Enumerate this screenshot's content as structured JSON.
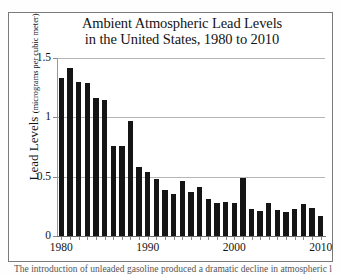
{
  "figure": {
    "background_color": "#ffffff",
    "frame_color": "#7a7a7a",
    "bar_color": "#151515",
    "grid_color": "#b6b6b6"
  },
  "title": {
    "line1": "Ambient Atmospheric Lead Levels",
    "line2": "in the United States, 1980 to 2010"
  },
  "yaxis": {
    "label_main": "Lead Levels ",
    "label_units": "(micrograms per cubic meter)",
    "ticks": [
      "0",
      "0.5",
      "1",
      "1.5"
    ]
  },
  "xaxis": {
    "ticks": [
      "1980",
      "1990",
      "2000",
      "2010"
    ]
  },
  "caption": {
    "text": "The introduction of unleaded gasoline produced a dramatic decline in atmospheric lead"
  },
  "chart_data": {
    "type": "bar",
    "title": "Ambient Atmospheric Lead Levels in the United States, 1980 to 2010",
    "xlabel": "",
    "ylabel": "Lead Levels (micrograms per cubic meter)",
    "ylim": [
      0,
      1.5
    ],
    "xlim": [
      1979.5,
      2010.5
    ],
    "yticks": [
      0,
      0.5,
      1,
      1.5
    ],
    "xticks": [
      1980,
      1990,
      2000,
      2010
    ],
    "grid": true,
    "legend": null,
    "categories": [
      "1980",
      "1981",
      "1982",
      "1983",
      "1984",
      "1985",
      "1986",
      "1987",
      "1988",
      "1989",
      "1990",
      "1991",
      "1992",
      "1993",
      "1994",
      "1995",
      "1996",
      "1997",
      "1998",
      "1999",
      "2000",
      "2001",
      "2002",
      "2003",
      "2004",
      "2005",
      "2006",
      "2007",
      "2008",
      "2009",
      "2010"
    ],
    "values": [
      1.33,
      1.42,
      1.3,
      1.29,
      1.16,
      1.15,
      0.76,
      0.76,
      0.97,
      0.58,
      0.54,
      0.48,
      0.39,
      0.35,
      0.46,
      0.37,
      0.41,
      0.31,
      0.28,
      0.29,
      0.28,
      0.49,
      0.23,
      0.21,
      0.28,
      0.22,
      0.2,
      0.23,
      0.27,
      0.24,
      0.17
    ]
  }
}
